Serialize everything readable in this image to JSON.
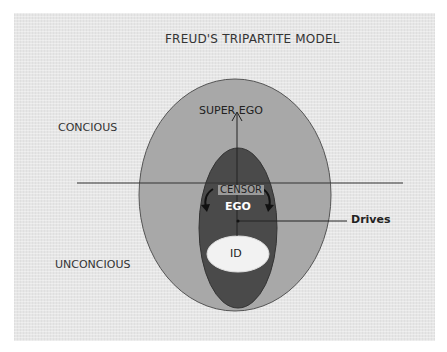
{
  "title": "FREUD'S TRIPARTITE MODEL",
  "regions": {
    "conscious_label": "CONCIOUS",
    "unconscious_label": "UNCONCIOUS"
  },
  "structures": {
    "superego_label": "SUPER EGO",
    "censor_label": "CENSOR",
    "ego_label": "EGO",
    "id_label": "ID",
    "drives_label": "Drives"
  },
  "colors": {
    "background": "#e6e6e6",
    "superego_fill": "#a8a8a8",
    "ego_fill": "#4a4a4a",
    "id_fill": "#f2f2f2",
    "line": "#333333"
  }
}
